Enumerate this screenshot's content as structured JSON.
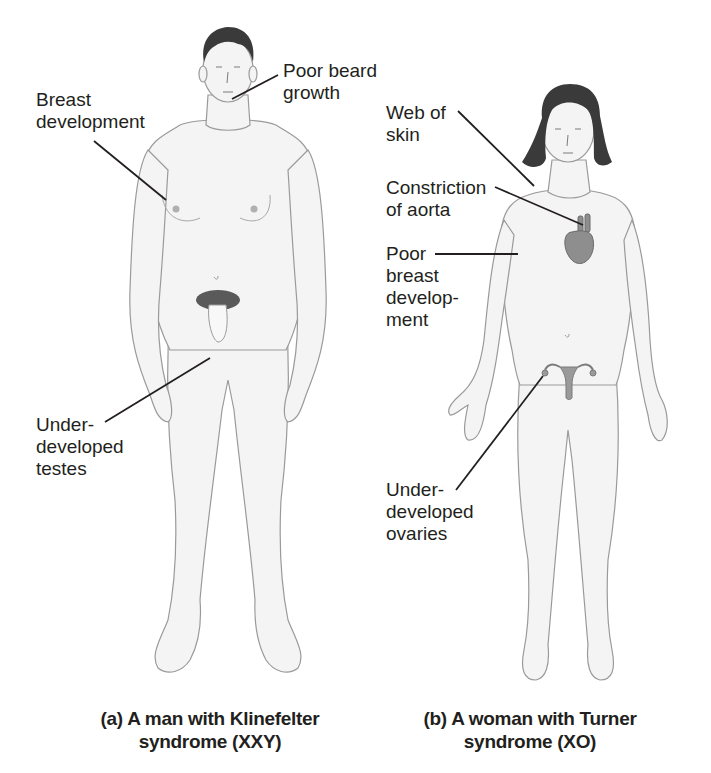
{
  "figure_a": {
    "caption": "(a) A man with Klinefelter\nsyndrome (XXY)",
    "labels": {
      "beard": "Poor beard\ngrowth",
      "breast": "Breast\ndevelopment",
      "testes": "Under-\ndeveloped\ntestes"
    }
  },
  "figure_b": {
    "caption": "(b) A woman with Turner\nsyndrome (XO)",
    "labels": {
      "web": "Web of\nskin",
      "aorta": "Constriction\nof aorta",
      "breast": "Poor\nbreast\ndevelop-\nment",
      "ovaries": "Under-\ndeveloped\novaries"
    }
  },
  "colors": {
    "skin_fill": "#f4f4f4",
    "outline": "#9a9a9a",
    "hair": "#3a3a3a",
    "organ": "#8e8e8e",
    "leader": "#231f20"
  }
}
